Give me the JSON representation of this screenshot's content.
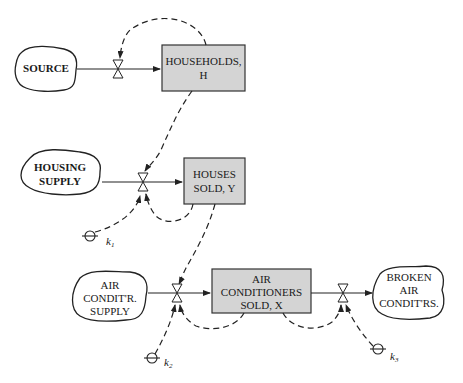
{
  "diagram": {
    "type": "stock-and-flow",
    "stocks": [
      {
        "id": "households",
        "line1": "HOUSEHOLDS,",
        "line2": "H"
      },
      {
        "id": "houses_sold",
        "line1": "HOUSES",
        "line2": "SOLD, Y"
      },
      {
        "id": "ac_sold",
        "line1": "AIR",
        "line2": "CONDITIONERS",
        "line3": "SOLD, X"
      }
    ],
    "clouds": [
      {
        "id": "source",
        "line1": "SOURCE"
      },
      {
        "id": "housing_supply",
        "line1": "HOUSING",
        "line2": "SUPPLY"
      },
      {
        "id": "ac_supply",
        "line1": "AIR",
        "line2": "CONDIT'R.",
        "line3": "SUPPLY"
      },
      {
        "id": "broken_ac",
        "line1": "BROKEN",
        "line2": "AIR",
        "line3": "CONDIT'RS."
      }
    ],
    "constants": [
      {
        "id": "k1",
        "symbol": "k",
        "subscript": "1"
      },
      {
        "id": "k2",
        "symbol": "k",
        "subscript": "2"
      },
      {
        "id": "k3",
        "symbol": "k",
        "subscript": "3"
      }
    ],
    "flows": [
      {
        "from": "source",
        "to": "households"
      },
      {
        "from": "housing_supply",
        "to": "houses_sold"
      },
      {
        "from": "ac_supply",
        "to": "ac_sold"
      },
      {
        "from": "ac_sold",
        "to": "broken_ac"
      }
    ],
    "colors": {
      "stock_fill": "#d4d4d4",
      "line": "#222222",
      "background": "#ffffff"
    }
  }
}
